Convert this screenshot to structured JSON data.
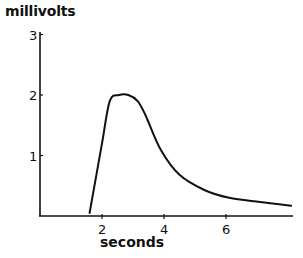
{
  "chart_data": {
    "type": "line",
    "title": "",
    "xlabel": "seconds",
    "ylabel": "millivolts",
    "xlim": [
      0,
      8.2
    ],
    "ylim": [
      0,
      3
    ],
    "x_ticks": [
      2,
      4,
      6
    ],
    "y_ticks": [
      1,
      2,
      3
    ],
    "grid": false,
    "legend": null,
    "series": [
      {
        "name": "response",
        "x": [
          1.6,
          2.0,
          2.25,
          2.55,
          2.85,
          3.15,
          3.4,
          3.9,
          4.5,
          5.3,
          6.1,
          7.1,
          8.1
        ],
        "values": [
          0.05,
          1.2,
          1.9,
          2.0,
          2.0,
          1.9,
          1.67,
          1.09,
          0.68,
          0.43,
          0.3,
          0.23,
          0.17
        ]
      }
    ],
    "line_color": "#111111"
  },
  "axes": {
    "ylabel": "millivolts",
    "xlabel": "seconds",
    "y_tick_labels": [
      "1",
      "2",
      "3"
    ],
    "x_tick_labels": [
      "2",
      "4",
      "6"
    ]
  }
}
